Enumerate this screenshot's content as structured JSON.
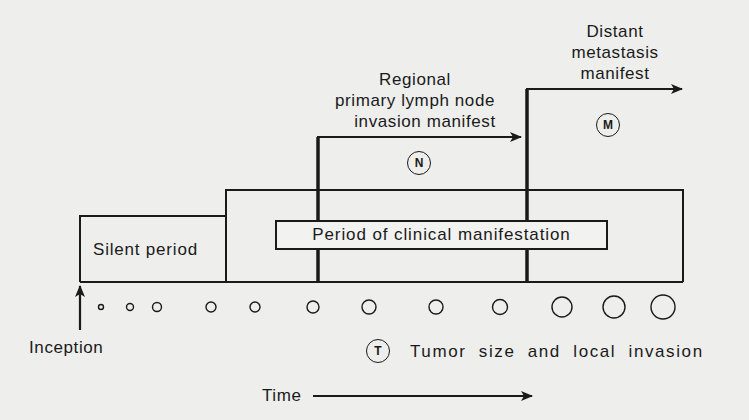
{
  "diagram": {
    "type": "tumor-progression-timeline",
    "colors": {
      "line": "#1a1a1a",
      "background": "#eeeeec"
    },
    "labels": {
      "silent_period": "Silent period",
      "clinical_period": "Period of clinical manifestation",
      "regional": {
        "line1": "Regional",
        "line2": "primary lymph node",
        "line3": "invasion manifest"
      },
      "distant": {
        "line1": "Distant",
        "line2": "metastasis",
        "line3": "manifest"
      },
      "inception": "Inception",
      "time": "Time",
      "tumor_legend": "Tumor size and local invasion"
    },
    "markers": {
      "N": "N",
      "M": "M",
      "T": "T"
    },
    "tumor_circles": [
      {
        "x": 101,
        "r": 2.5
      },
      {
        "x": 130,
        "r": 3.5
      },
      {
        "x": 157,
        "r": 4.5
      },
      {
        "x": 211,
        "r": 5
      },
      {
        "x": 255,
        "r": 5
      },
      {
        "x": 313,
        "r": 6
      },
      {
        "x": 369,
        "r": 7
      },
      {
        "x": 436,
        "r": 7
      },
      {
        "x": 500,
        "r": 7.5
      },
      {
        "x": 562,
        "r": 10
      },
      {
        "x": 614,
        "r": 11
      },
      {
        "x": 663,
        "r": 12
      }
    ]
  }
}
